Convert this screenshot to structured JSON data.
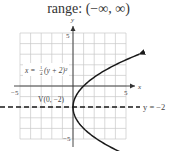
{
  "title": "range: (−∞, ∞)",
  "chart_data": {
    "type": "line",
    "title": "range: (−∞, ∞)",
    "xlabel": "x",
    "ylabel": "y",
    "xlim": [
      -5,
      5
    ],
    "ylim": [
      -5,
      5
    ],
    "grid": true,
    "x_ticks_labeled": [
      -5,
      5
    ],
    "y_ticks_labeled": [
      5,
      -5
    ],
    "series": [
      {
        "name": "x = 1/4(y + 2)^2",
        "equation_label": "x = ¼(y + 2)²",
        "style": "solid",
        "color": "#1a1a1a",
        "points": [
          {
            "x": 6.25,
            "y": 3
          },
          {
            "x": 4,
            "y": 2
          },
          {
            "x": 2.25,
            "y": 1
          },
          {
            "x": 1,
            "y": 0
          },
          {
            "x": 0.25,
            "y": -1
          },
          {
            "x": 0,
            "y": -2
          },
          {
            "x": 0.25,
            "y": -3
          },
          {
            "x": 1,
            "y": -4
          },
          {
            "x": 2.25,
            "y": -5
          },
          {
            "x": 4,
            "y": -6
          }
        ]
      },
      {
        "name": "axis of symmetry",
        "equation_label": "y = −2",
        "style": "dashed",
        "color": "#1a1a1a",
        "points": [
          {
            "x": -7,
            "y": -2
          },
          {
            "x": 6,
            "y": -2
          }
        ]
      }
    ],
    "annotations": [
      {
        "text": "V(0, −2)",
        "x": 0,
        "y": -2,
        "meaning": "vertex"
      },
      {
        "text": "x = ¼(y + 2)²",
        "meaning": "curve equation"
      },
      {
        "text": "y = −2",
        "meaning": "axis of symmetry"
      }
    ]
  },
  "labels": {
    "axis_x": "x",
    "axis_y": "y",
    "tick_x_neg": "−5",
    "tick_x_pos": "5",
    "tick_y_pos": "5",
    "tick_y_neg": "−5",
    "equation": "x = ",
    "eq_tail": "(y + 2)²",
    "frac_num": "1",
    "frac_den": "4",
    "vertex": "V(0, −2)",
    "symmetry": "y = −2"
  },
  "colors": {
    "grid": "#c8c8c8",
    "axis": "#333333",
    "curve": "#1a1a1a"
  }
}
